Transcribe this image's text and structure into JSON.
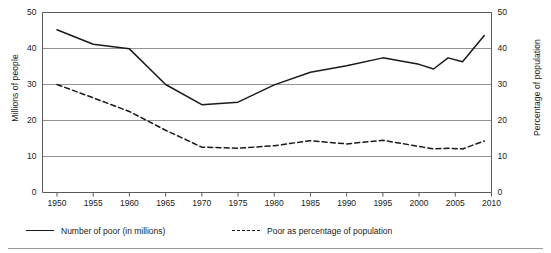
{
  "chart_data": {
    "type": "line",
    "title": "",
    "xlabel": "",
    "ylabel": "Millions of people",
    "y2label": "Percentage of population",
    "xlim": [
      1948,
      2010
    ],
    "ylim": [
      0,
      50
    ],
    "y2lim": [
      0,
      50
    ],
    "grid": true,
    "legend_position": "bottom",
    "xticks": [
      "1950",
      "1955",
      "1960",
      "1965",
      "1970",
      "1975",
      "1980",
      "1985",
      "1990",
      "1995",
      "2000",
      "2005",
      "2010"
    ],
    "yticks": [
      "0",
      "10",
      "20",
      "30",
      "40",
      "50"
    ],
    "y2ticks": [
      "0",
      "10",
      "20",
      "30",
      "40",
      "50"
    ],
    "series": [
      {
        "name": "Number of poor (in millions)",
        "style": "solid",
        "axis": "left",
        "color": "#1a1a1a",
        "x": [
          1950,
          1955,
          1960,
          1965,
          1970,
          1975,
          1980,
          1985,
          1990,
          1995,
          2000,
          2002,
          2004,
          2006,
          2009
        ],
        "values": [
          45.2,
          41.2,
          39.9,
          30.0,
          24.4,
          25.1,
          29.9,
          33.4,
          35.2,
          37.4,
          35.6,
          34.3,
          37.4,
          36.3,
          43.6
        ]
      },
      {
        "name": "Poor as percentage of population",
        "style": "dashed",
        "axis": "right",
        "color": "#1a1a1a",
        "x": [
          1950,
          1955,
          1960,
          1965,
          1970,
          1975,
          1980,
          1985,
          1990,
          1995,
          2000,
          2002,
          2004,
          2006,
          2009
        ],
        "values": [
          30.0,
          26.3,
          22.5,
          17.3,
          12.6,
          12.3,
          13.0,
          14.4,
          13.5,
          14.5,
          12.8,
          12.1,
          12.3,
          12.1,
          14.3
        ]
      }
    ]
  },
  "axes": {
    "left_title": "Millions of people",
    "right_title": "Percentage of population"
  },
  "legend": {
    "entries": [
      {
        "label": "Number of poor (in millions)",
        "style": "solid"
      },
      {
        "label": "Poor as percentage of population",
        "style": "dashed"
      }
    ]
  }
}
